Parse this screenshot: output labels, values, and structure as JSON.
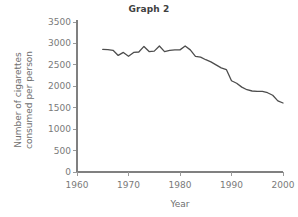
{
  "figure": {
    "title": "Graph 2",
    "background_color": "#ffffff",
    "text_color": "#7a7a7a"
  },
  "chart_data": {
    "type": "line",
    "title": "Graph 2",
    "xlabel": "Year",
    "ylabel": "Number of cigarettes consumed per person",
    "ylabel_lines": [
      "Number of cigarettes",
      "consumed per person"
    ],
    "xlim": [
      1958,
      2001
    ],
    "ylim": [
      0,
      3500
    ],
    "xticks": [
      1960,
      1970,
      1980,
      1990,
      2000
    ],
    "yticks": [
      0,
      500,
      1000,
      1500,
      2000,
      2500,
      3000,
      3500
    ],
    "xtick_labels": [
      "1960",
      "1970",
      "1980",
      "1990",
      "2000"
    ],
    "ytick_labels": [
      "0",
      "500",
      "1000",
      "1500",
      "2000",
      "2500",
      "3000",
      "3500"
    ],
    "grid": false,
    "legend": false,
    "line_color": "#4d4d4d",
    "series": [
      {
        "name": "Cigarettes consumed per person",
        "x": [
          1965,
          1966,
          1967,
          1968,
          1969,
          1970,
          1971,
          1972,
          1973,
          1974,
          1975,
          1976,
          1977,
          1978,
          1979,
          1980,
          1981,
          1982,
          1983,
          1984,
          1985,
          1986,
          1987,
          1988,
          1989,
          1990,
          1991,
          1992,
          1993,
          1994,
          1995,
          1996,
          1997,
          1998,
          1999,
          2000
        ],
        "y": [
          2860,
          2855,
          2840,
          2720,
          2790,
          2700,
          2790,
          2800,
          2930,
          2810,
          2820,
          2940,
          2810,
          2840,
          2850,
          2850,
          2940,
          2850,
          2700,
          2680,
          2620,
          2570,
          2500,
          2430,
          2390,
          2130,
          2070,
          1980,
          1920,
          1890,
          1880,
          1880,
          1850,
          1790,
          1660,
          1610
        ]
      }
    ]
  }
}
